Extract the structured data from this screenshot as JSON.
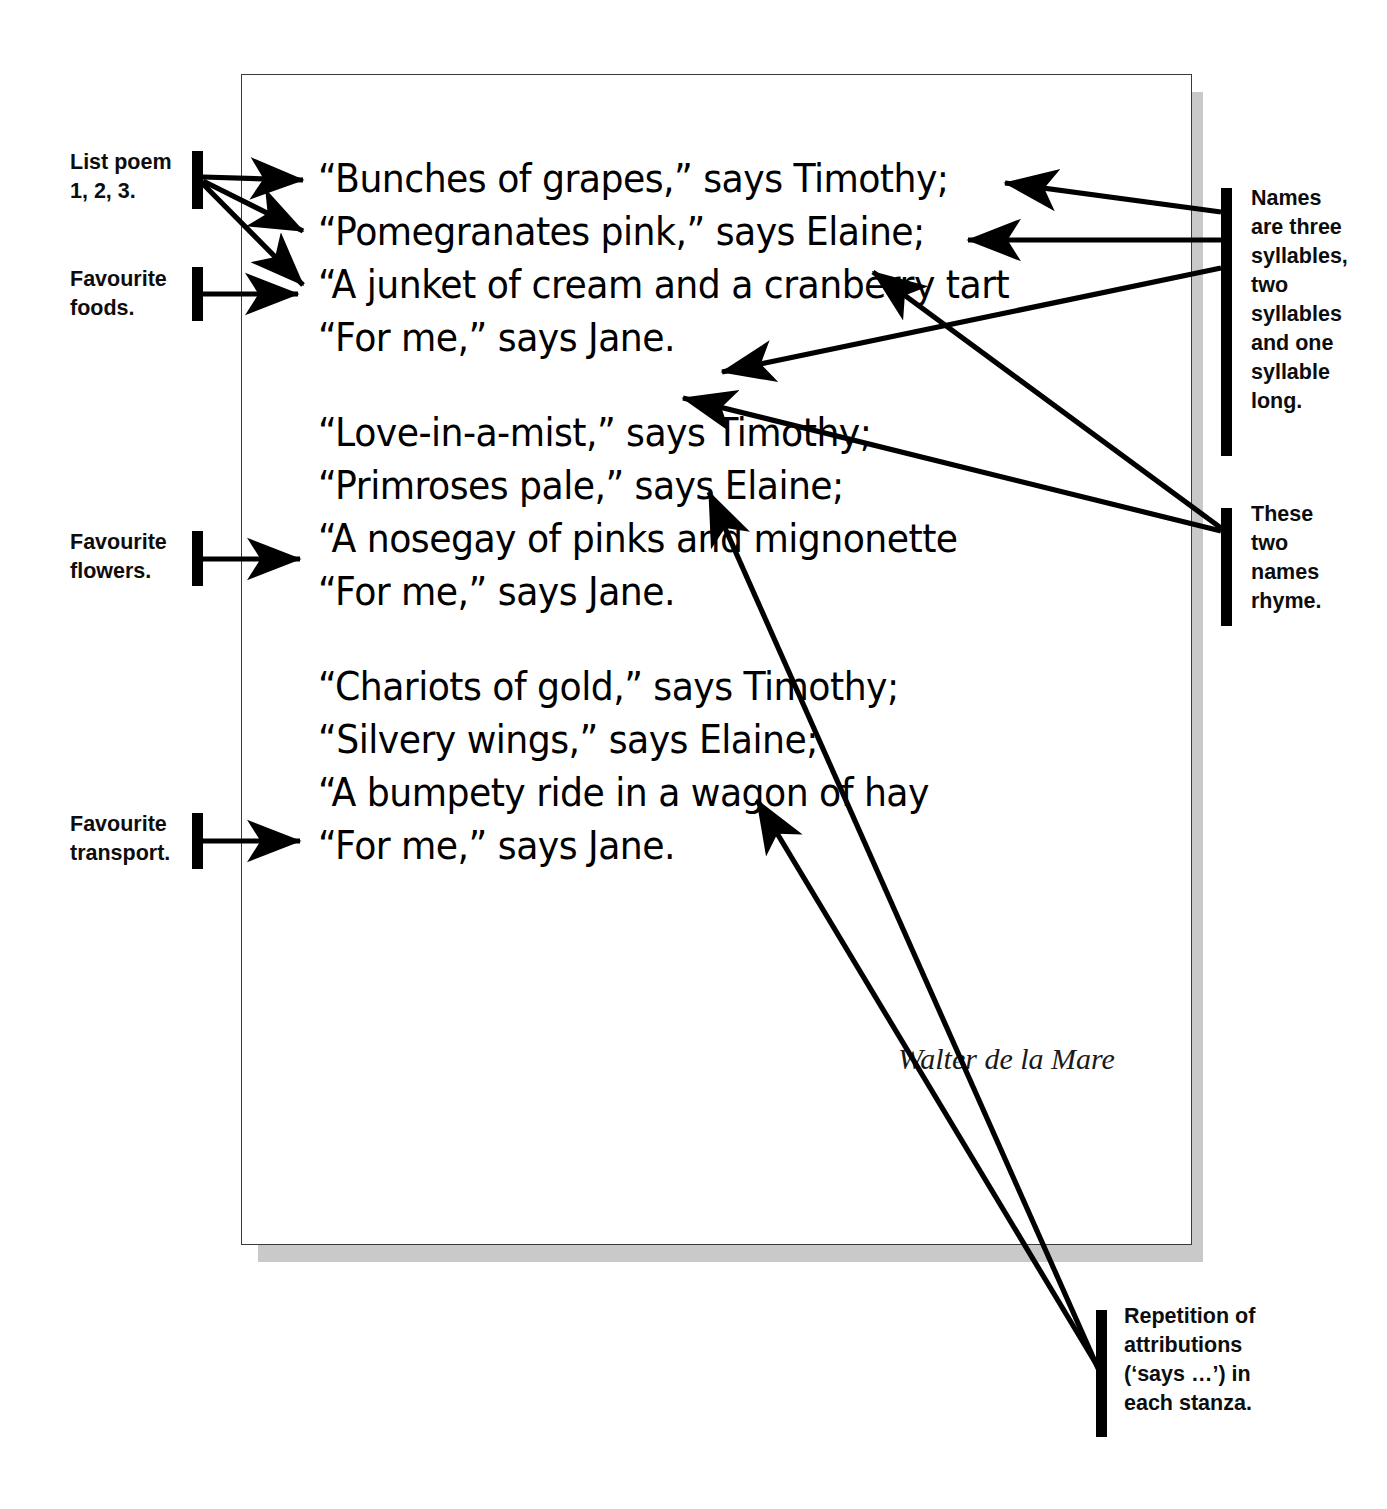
{
  "document": {
    "type": "annotated-poem-page",
    "author_credit": "Walter de la Mare"
  },
  "poem": {
    "stanzas": [
      {
        "id": "stanza-1",
        "lines": [
          "“Bunches of grapes,” says Timothy;",
          "“Pomegranates pink,” says Elaine;",
          "“A junket of cream and a cranberry tart",
          "“For me,” says Jane."
        ]
      },
      {
        "id": "stanza-2",
        "lines": [
          "“Love-in-a-mist,” says Timothy;",
          "“Primroses pale,” says Elaine;",
          "“A nosegay of pinks and mignonette",
          "“For me,” says Jane."
        ]
      },
      {
        "id": "stanza-3",
        "lines": [
          "“Chariots of gold,” says Timothy;",
          "“Silvery wings,” says Elaine;",
          "“A bumpety ride in a wagon of hay",
          "“For me,” says Jane."
        ]
      }
    ]
  },
  "annotations": {
    "left": [
      {
        "id": "list-poem",
        "text": "List poem\n1, 2, 3."
      },
      {
        "id": "favourite-foods",
        "text": "Favourite\nfoods."
      },
      {
        "id": "favourite-flowers",
        "text": "Favourite\nflowers."
      },
      {
        "id": "favourite-transport",
        "text": "Favourite\ntransport."
      }
    ],
    "right": [
      {
        "id": "names-syllables",
        "text": "Names\nare three\nsyllables,\ntwo\nsyllables\nand one\nsyllable\nlong."
      },
      {
        "id": "names-rhyme",
        "text": "These\ntwo\nnames\nrhyme."
      },
      {
        "id": "repetition",
        "text": "Repetition of\nattributions\n(‘says …’) in\neach stanza."
      }
    ]
  },
  "colors": {
    "ink": "#000000",
    "page_border": "#3a3a3a",
    "page_shadow": "#c9c9c9",
    "background": "#ffffff"
  }
}
